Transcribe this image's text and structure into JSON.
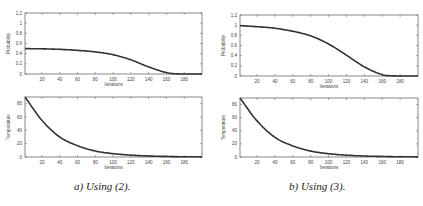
{
  "chart_data": [
    {
      "type": "line",
      "panel": "a",
      "title": "",
      "xlabel": "Iterations",
      "ylabel": "Probability",
      "xlim": [
        1,
        200
      ],
      "ylim": [
        0,
        1.2
      ],
      "xticks": [
        20,
        40,
        60,
        80,
        100,
        120,
        140,
        160,
        180
      ],
      "yticks": [
        0,
        0.2,
        0.4,
        0.6,
        0.8,
        1,
        1.2
      ],
      "x": [
        1,
        20,
        40,
        60,
        80,
        100,
        120,
        140,
        160,
        170,
        180,
        200
      ],
      "series": [
        {
          "name": "Probability",
          "values": [
            0.5,
            0.495,
            0.485,
            0.465,
            0.435,
            0.38,
            0.28,
            0.14,
            0.03,
            0.005,
            0.0,
            0.0
          ]
        }
      ]
    },
    {
      "type": "line",
      "panel": "a",
      "title": "",
      "xlabel": "Iterations",
      "ylabel": "Temperature",
      "xlim": [
        1,
        200
      ],
      "ylim": [
        0,
        90
      ],
      "xticks": [
        20,
        40,
        60,
        80,
        100,
        120,
        140,
        160,
        180
      ],
      "yticks": [
        0,
        20,
        40,
        60,
        80
      ],
      "x": [
        1,
        20,
        40,
        60,
        80,
        100,
        120,
        140,
        160,
        180,
        200
      ],
      "series": [
        {
          "name": "Temperature",
          "values": [
            90,
            55,
            30,
            17,
            9,
            5,
            2.8,
            1.5,
            0.8,
            0.4,
            0.2
          ]
        }
      ]
    },
    {
      "type": "line",
      "panel": "b",
      "title": "",
      "xlabel": "Iterations",
      "ylabel": "Probability",
      "xlim": [
        1,
        200
      ],
      "ylim": [
        0,
        1.2
      ],
      "xticks": [
        20,
        40,
        60,
        80,
        100,
        120,
        140,
        160,
        180
      ],
      "yticks": [
        0,
        0.2,
        0.4,
        0.6,
        0.8,
        1,
        1.2
      ],
      "x": [
        1,
        20,
        40,
        60,
        80,
        100,
        120,
        140,
        160,
        170,
        180,
        200
      ],
      "series": [
        {
          "name": "Probability",
          "values": [
            0.99,
            0.97,
            0.94,
            0.88,
            0.79,
            0.63,
            0.41,
            0.18,
            0.03,
            0.005,
            0.0,
            0.0
          ]
        }
      ]
    },
    {
      "type": "line",
      "panel": "b",
      "title": "",
      "xlabel": "Iterations",
      "ylabel": "Temperature",
      "xlim": [
        1,
        200
      ],
      "ylim": [
        0,
        90
      ],
      "xticks": [
        20,
        40,
        60,
        80,
        100,
        120,
        140,
        160,
        180
      ],
      "yticks": [
        0,
        20,
        40,
        60,
        80
      ],
      "x": [
        1,
        20,
        40,
        60,
        80,
        100,
        120,
        140,
        160,
        180,
        200
      ],
      "series": [
        {
          "name": "Temperature",
          "values": [
            90,
            55,
            30,
            17,
            9,
            5,
            2.8,
            1.5,
            0.8,
            0.4,
            0.2
          ]
        }
      ]
    }
  ],
  "captions": {
    "a": "a) Using (2).",
    "b": "b) Using (3)."
  }
}
